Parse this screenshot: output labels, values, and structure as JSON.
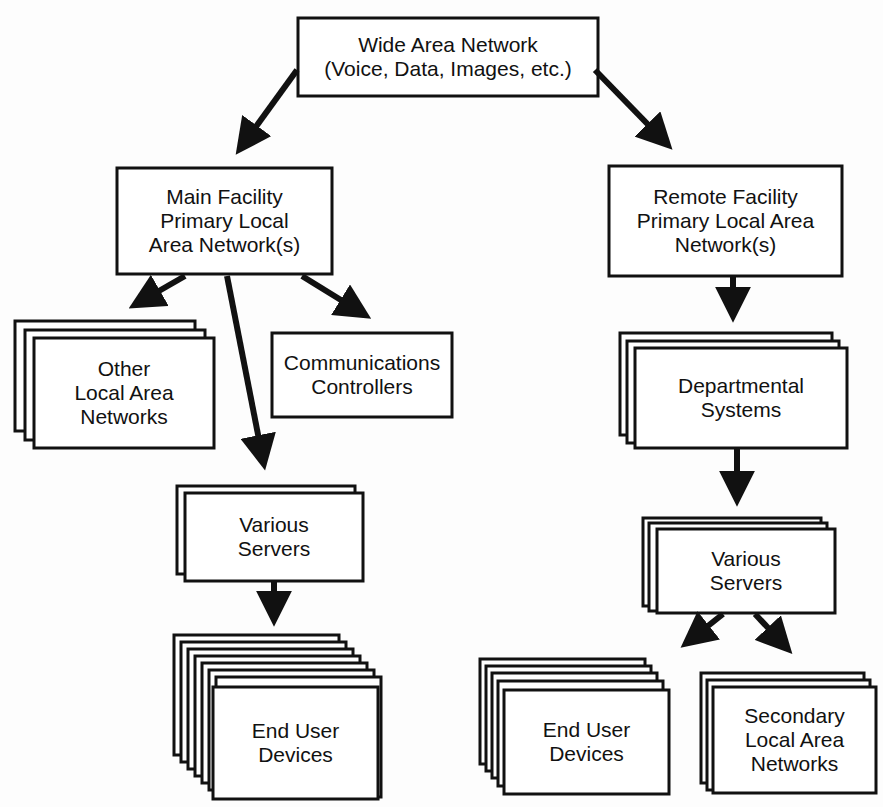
{
  "diagram": {
    "nodes": {
      "wan": {
        "label": "Wide Area Network\n(Voice, Data, Images, etc.)"
      },
      "main_lan": {
        "label": "Main Facility\nPrimary Local\nArea Network(s)"
      },
      "remote_lan": {
        "label": "Remote Facility\nPrimary Local Area\nNetwork(s)"
      },
      "other_lans": {
        "label": "Other\nLocal Area\nNetworks",
        "stack": 3
      },
      "comm_controllers": {
        "label": "Communications\nControllers",
        "stack": 1
      },
      "main_servers": {
        "label": "Various\nServers",
        "stack": 2
      },
      "main_end_user": {
        "label": "End User\nDevices",
        "stack": 8
      },
      "dept_systems": {
        "label": "Departmental\nSystems",
        "stack": 3
      },
      "remote_servers": {
        "label": "Various\nServers",
        "stack": 3
      },
      "remote_end_user": {
        "label": "End User\nDevices",
        "stack": 5
      },
      "secondary_lans": {
        "label": "Secondary\nLocal Area\nNetworks",
        "stack": 3
      }
    },
    "edges": [
      [
        "wan",
        "main_lan"
      ],
      [
        "wan",
        "remote_lan"
      ],
      [
        "main_lan",
        "other_lans"
      ],
      [
        "main_lan",
        "comm_controllers"
      ],
      [
        "main_lan",
        "main_servers"
      ],
      [
        "main_servers",
        "main_end_user"
      ],
      [
        "remote_lan",
        "dept_systems"
      ],
      [
        "dept_systems",
        "remote_servers"
      ],
      [
        "remote_servers",
        "remote_end_user"
      ],
      [
        "remote_servers",
        "secondary_lans"
      ]
    ],
    "colors": {
      "stroke": "#111111",
      "fill": "#ffffff",
      "background": "#fdfdfd"
    }
  }
}
